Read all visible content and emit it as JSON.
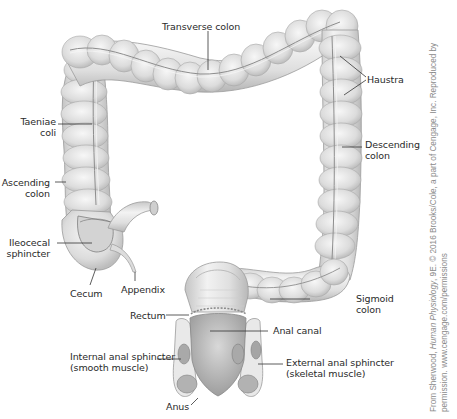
{
  "figure": {
    "colors": {
      "tissue_fill": "#e6e6e6",
      "tissue_shade": "#bdbdbd",
      "tissue_outline": "#9a9a9a",
      "muscle_fill": "#a9a9a9",
      "label_text": "#2a2a2a",
      "leader_line": "#333333",
      "credit_text": "#8a8a8a"
    }
  },
  "labels": {
    "transverse_colon": "Transverse colon",
    "haustra": "Haustra",
    "taeniae_coli_1": "Taeniae",
    "taeniae_coli_2": "coli",
    "descending_colon_1": "Descending",
    "descending_colon_2": "colon",
    "ascending_colon_1": "Ascending",
    "ascending_colon_2": "colon",
    "ileocecal_sphincter_1": "Ileocecal",
    "ileocecal_sphincter_2": "sphincter",
    "cecum": "Cecum",
    "appendix": "Appendix",
    "rectum": "Rectum",
    "sigmoid_colon_1": "Sigmoid",
    "sigmoid_colon_2": "colon",
    "anal_canal": "Anal canal",
    "internal_anal_sphincter_1": "Internal anal sphincter",
    "internal_anal_sphincter_2": "(smooth muscle)",
    "external_anal_sphincter_1": "External anal sphincter",
    "external_anal_sphincter_2": "(skeletal muscle)",
    "anus": "Anus"
  },
  "credit": {
    "line1_prefix": "From Sherwood, ",
    "line1_title": "Human Physiology",
    "line1_suffix": ", 9E. © 2016 Brooks/Cole, a part of Cengage, Inc. Reproduced by",
    "line2": "permission. www.cengage.com/permissions"
  }
}
